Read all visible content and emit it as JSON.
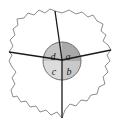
{
  "figure": {
    "name": "cell-sector-diagram",
    "background_color": "#ffffff",
    "outline_color": "#8c8c8c",
    "line_color": "#1a1a1a",
    "center": {
      "x": 62,
      "y": 60
    }
  },
  "central_circle": {
    "name": "central-circle",
    "cx": 62,
    "cy": 61,
    "r": 19,
    "stroke": "#6e6e6e",
    "quadrants": [
      {
        "key": "a",
        "label": "a",
        "position": "upper-right",
        "fill": "#a9a9a9",
        "label_x": 68,
        "label_y": 58
      },
      {
        "key": "b",
        "label": "b",
        "position": "lower-right",
        "fill": "#c9c9c9",
        "label_x": 69,
        "label_y": 73
      },
      {
        "key": "c",
        "label": "c",
        "position": "lower-left",
        "fill": "#dcdcdc",
        "label_x": 54,
        "label_y": 73
      },
      {
        "key": "d",
        "label": "d",
        "position": "upper-left",
        "fill": "#c4c4c4",
        "label_x": 53,
        "label_y": 58
      }
    ]
  },
  "radiating_lines": [
    {
      "key": "up",
      "name": "radial-line-up",
      "x2": 55,
      "y2": 11
    },
    {
      "key": "left",
      "name": "radial-line-left",
      "x2": 9,
      "y2": 52
    },
    {
      "key": "right",
      "name": "radial-line-right",
      "x2": 111,
      "y2": 50
    },
    {
      "key": "down",
      "name": "radial-line-down",
      "x2": 62,
      "y2": 118
    }
  ],
  "cell_outline": {
    "name": "cell-outline",
    "path": "M55,11 L62,13 L69,10 L76,14 L82,12 L88,17 L93,15 L97,21 L103,24 L101,31 L106,35 L103,41 L108,45 L111,50 L107,55 L110,61 L105,66 L108,72 L103,77 L105,84 L99,87 L97,94 L91,95 L87,101 L81,100 L76,106 L70,104 L65,110 L62,118 L57,112 L51,115 L46,110 L40,112 L36,106 L30,107 L26,101 L21,102 L17,96 L13,97 L11,90 L15,84 L12,78 L16,72 L12,67 L9,61 L12,55 L9,52 L13,46 L10,40 L15,35 L13,29 L18,25 L17,19 L24,18 L28,13 L34,15 L39,10 L45,13 L50,9 Z"
  }
}
